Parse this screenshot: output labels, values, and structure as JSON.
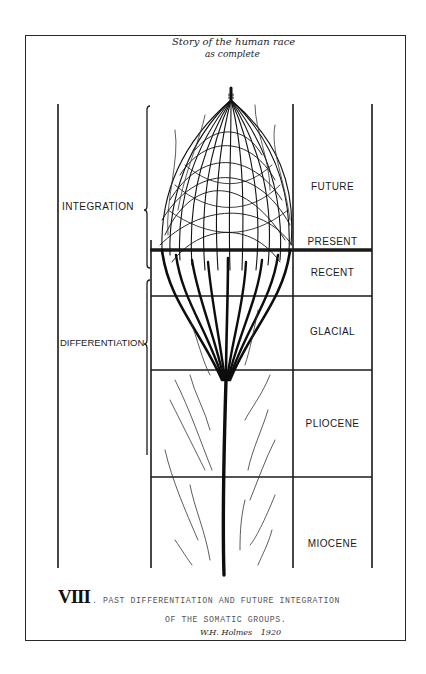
{
  "title_handwritten": {
    "line1": "Story of the human race",
    "line2": "as complete"
  },
  "left_labels": [
    {
      "id": "integration",
      "label": "INTEGRATION"
    },
    {
      "id": "differentiation",
      "label": "DIFFERENTIATION"
    }
  ],
  "eras": [
    {
      "id": "future",
      "label": "FUTURE"
    },
    {
      "id": "present",
      "label": "PRESENT"
    },
    {
      "id": "recent",
      "label": "RECENT"
    },
    {
      "id": "glacial",
      "label": "GLACIAL"
    },
    {
      "id": "pliocene",
      "label": "PLIOCENE"
    },
    {
      "id": "miocene",
      "label": "MIOCENE"
    }
  ],
  "caption": {
    "number": "VIII",
    "line1": ". PAST DIFFERENTIATION AND FUTURE INTEGRATION",
    "line2": "OF THE SOMATIC GROUPS."
  },
  "signature": {
    "name": "W.H. Holmes",
    "year": "1920"
  },
  "colors": {
    "ink": "#111111",
    "paper": "#ffffff"
  }
}
